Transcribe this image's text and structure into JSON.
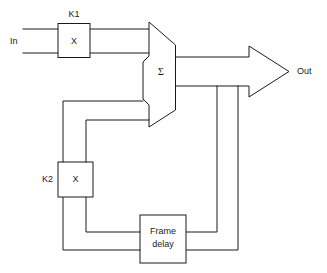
{
  "diagram": {
    "type": "signal-flow-block-diagram",
    "line_color": "#1a1a1a",
    "background_color": "#ffffff",
    "blocks": [
      {
        "id": "k1-multiplier",
        "label": "K1",
        "symbol": "X",
        "kind": "multiplier",
        "label_position": "above"
      },
      {
        "id": "summer",
        "label": "Σ",
        "kind": "adder",
        "shape": "trapezoid-notched"
      },
      {
        "id": "k2-multiplier",
        "label": "K2",
        "symbol": "X",
        "kind": "multiplier",
        "label_position": "left"
      },
      {
        "id": "frame-delay",
        "label_line1": "Frame",
        "label_line2": "delay",
        "kind": "delay"
      }
    ],
    "ports": [
      {
        "id": "input-port",
        "label": "In",
        "direction": "input"
      },
      {
        "id": "output-port",
        "label": "Out",
        "direction": "output",
        "marker": "block-arrow"
      }
    ]
  }
}
